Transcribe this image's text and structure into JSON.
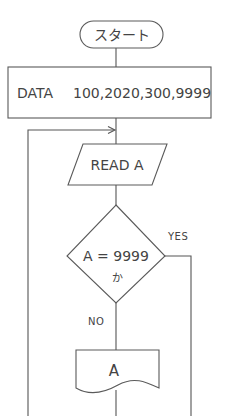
{
  "flowchart": {
    "start": {
      "label": "スタート",
      "shape": "terminal"
    },
    "data_step": {
      "label": "DATA　100,2020,300,9999",
      "keyword": "DATA",
      "values": "100,2020,300,9999",
      "shape": "process"
    },
    "read_step": {
      "label": "READ A",
      "shape": "input-output"
    },
    "decision": {
      "line1": "A = 9999",
      "line2": "か",
      "shape": "decision"
    },
    "yes_label": "YES",
    "no_label": "NO",
    "output_step": {
      "label": "A",
      "shape": "document"
    },
    "colors": {
      "line": "#555555",
      "text": "#444444",
      "background": "#ffffff"
    }
  }
}
